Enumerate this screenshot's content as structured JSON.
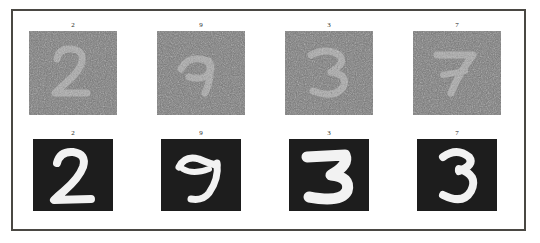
{
  "figure": {
    "type": "image-grid",
    "rows": 2,
    "columns": 4,
    "frame_color": "#4a4843",
    "background_color": "#ffffff",
    "digit_stroke_color": "#f2f2f2",
    "tile_background_color": "#1d1d1d",
    "noise_tile_background_color": "#7e7e7e"
  },
  "rows": [
    {
      "name": "noisy-row",
      "cells": [
        {
          "label": "2",
          "digit": "2",
          "condition": "noisy"
        },
        {
          "label": "9",
          "digit": "9",
          "condition": "noisy"
        },
        {
          "label": "3",
          "digit": "3",
          "condition": "noisy"
        },
        {
          "label": "7",
          "digit": "7",
          "condition": "noisy"
        }
      ]
    },
    {
      "name": "clean-row",
      "cells": [
        {
          "label": "2",
          "digit": "2",
          "condition": "clean"
        },
        {
          "label": "9",
          "digit": "9",
          "condition": "clean"
        },
        {
          "label": "3",
          "digit": "3",
          "condition": "clean"
        },
        {
          "label": "7",
          "digit": "7",
          "condition": "clean"
        }
      ]
    }
  ]
}
